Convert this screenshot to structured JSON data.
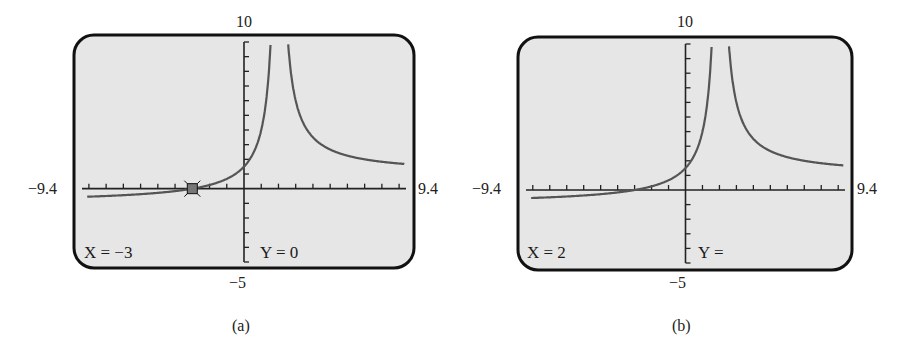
{
  "figure": {
    "panels": [
      {
        "id": "a",
        "caption": "(a)",
        "window": {
          "xmin_label": "−9.4",
          "xmax_label": "9.4",
          "ymax_label": "10",
          "ymin_label": "−5"
        },
        "readout": {
          "x_text": "X = −3",
          "y_text": "Y = 0"
        },
        "trace_point": {
          "x": -3,
          "y": 0,
          "shown": true
        }
      },
      {
        "id": "b",
        "caption": "(b)",
        "window": {
          "xmin_label": "−9.4",
          "xmax_label": "9.4",
          "ymax_label": "10",
          "ymin_label": "−5"
        },
        "readout": {
          "x_text": "X = 2",
          "y_text": "Y ="
        },
        "trace_point": {
          "x": 2,
          "y": null,
          "shown": false
        }
      }
    ],
    "colors": {
      "screen_bg": "#e6e6e6",
      "frame": "#111111",
      "curve": "#555555",
      "axis": "#222222",
      "marker": "#777777"
    }
  },
  "chart_data": [
    {
      "type": "line",
      "title": "(a)",
      "xlabel": "",
      "ylabel": "",
      "xlim": [
        -9.4,
        9.4
      ],
      "ylim": [
        -5,
        10
      ],
      "x_tick_step": 1,
      "y_tick_step": 1,
      "grid": false,
      "vertical_asymptote": 2,
      "series": [
        {
          "name": "y = f(x)",
          "x": [
            -9.4,
            -8,
            -6,
            -4,
            -3,
            -2,
            -1,
            0,
            1,
            1.5,
            1.7,
            2.3,
            2.5,
            3,
            4,
            5,
            6,
            7,
            8,
            9,
            9.4
          ],
          "y": [
            -0.56,
            -0.5,
            -0.38,
            -0.17,
            0,
            0.25,
            0.67,
            1.5,
            4,
            9,
            15.7,
            17.7,
            11,
            6,
            3.5,
            2.67,
            2.25,
            2,
            1.83,
            1.71,
            1.68
          ]
        }
      ],
      "annotations": [
        {
          "text": "X = −3",
          "position": "bottom-left"
        },
        {
          "text": "Y = 0",
          "position": "bottom-center"
        },
        {
          "marker": "trace cursor",
          "x": -3,
          "y": 0
        }
      ]
    },
    {
      "type": "line",
      "title": "(b)",
      "xlabel": "",
      "ylabel": "",
      "xlim": [
        -9.4,
        9.4
      ],
      "ylim": [
        -5,
        10
      ],
      "x_tick_step": 1,
      "y_tick_step": 1,
      "grid": false,
      "vertical_asymptote": 2,
      "series": [
        {
          "name": "y = f(x)",
          "x": [
            -9.4,
            -8,
            -6,
            -4,
            -3,
            -2,
            -1,
            0,
            1,
            1.5,
            1.7,
            2.3,
            2.5,
            3,
            4,
            5,
            6,
            7,
            8,
            9,
            9.4
          ],
          "y": [
            -0.56,
            -0.5,
            -0.38,
            -0.17,
            0,
            0.25,
            0.67,
            1.5,
            4,
            9,
            15.7,
            17.7,
            11,
            6,
            3.5,
            2.67,
            2.25,
            2,
            1.83,
            1.71,
            1.68
          ]
        }
      ],
      "annotations": [
        {
          "text": "X = 2",
          "position": "bottom-left"
        },
        {
          "text": "Y =",
          "position": "bottom-center"
        }
      ]
    }
  ]
}
